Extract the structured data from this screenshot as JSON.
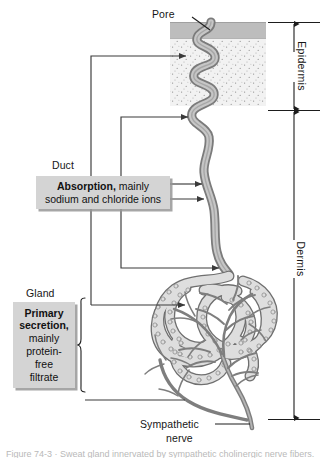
{
  "figure": {
    "background_color": "#ffffff"
  },
  "labels": {
    "pore": "Pore",
    "duct": "Duct",
    "gland": "Gland",
    "sympathetic_nerve_line1": "Sympathetic",
    "sympathetic_nerve_line2": "nerve",
    "epidermis": "Epidermis",
    "dermis": "Dermis"
  },
  "callouts": {
    "absorption": {
      "bold_text": "Absorption,",
      "line1_rest": " mainly",
      "line2": "sodium and chloride ions",
      "fill_color": "#d4d4d4"
    },
    "secretion": {
      "bold_line1": "Primary",
      "bold_line2": "secretion,",
      "line3": "mainly",
      "line4": "protein-",
      "line5": "free",
      "line6": "filtrate",
      "fill_color": "#d4d4d4"
    }
  },
  "colors": {
    "stratum_corneum": "#bcbcbc",
    "epidermis_stipple": "#ededed",
    "duct_fill": "#c9c9c9",
    "duct_outline": "#6e6e6e",
    "gland_fill": "#dcdcdc",
    "gland_outline": "#707070",
    "nerve": "#828282",
    "leader_line": "#3a3a3a",
    "text": "#161616"
  },
  "caption": {
    "text": "Figure 74-3 · Sweat gland innervated by sympathetic cholinergic nerve fibers."
  }
}
